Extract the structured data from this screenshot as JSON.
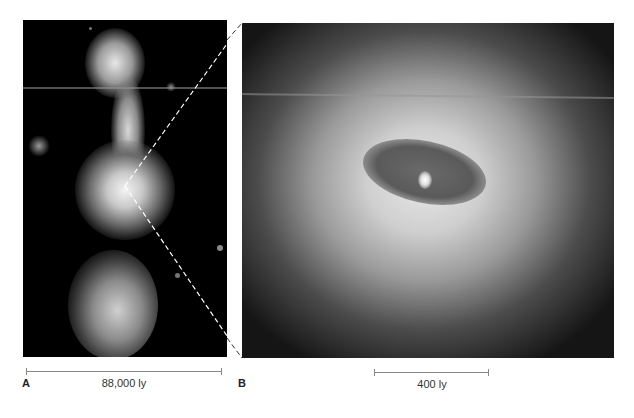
{
  "figure": {
    "panels": [
      {
        "letter": "A",
        "description": "Wide-field image of galaxy with jets/lobes extending above and below a bright core",
        "scale_bar_label": "88,000 ly"
      },
      {
        "letter": "B",
        "description": "Zoomed view of galactic core showing a dark dusty disk around a bright nucleus",
        "scale_bar_label": "400 ly"
      }
    ],
    "connector": "dashed-zoom-lines",
    "colors": {
      "background": "#ffffff",
      "image_black": "#000000",
      "scale_bar": "#888888",
      "label_text": "#333333"
    }
  }
}
